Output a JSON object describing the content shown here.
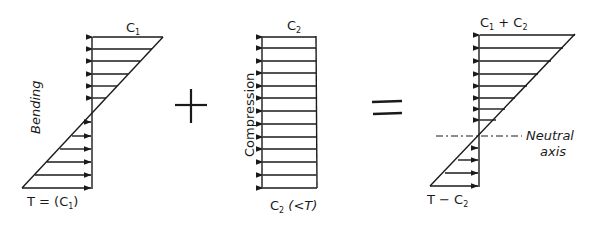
{
  "diagram": {
    "type": "stress-superposition",
    "colors": {
      "ink": "#1a1a1a",
      "background": "#ffffff"
    },
    "panels": [
      {
        "id": "bending",
        "side_label": "Bending",
        "top_label": {
          "main": "C",
          "sub": "1",
          "suffix": ""
        },
        "bottom_label": {
          "prefix": "T = (C",
          "sub": "1",
          "suffix": ")"
        },
        "distribution": "triangular-antisymmetric",
        "compression_arrows": 6,
        "tension_arrows": 6
      },
      {
        "id": "compression",
        "side_label": "Compression",
        "top_label": {
          "main": "C",
          "sub": "2",
          "suffix": ""
        },
        "bottom_label": {
          "prefix": "C",
          "sub": "2",
          "suffix": " (<T)"
        },
        "distribution": "uniform",
        "compression_arrows": 13
      },
      {
        "id": "combined",
        "top_label": {
          "main": "C",
          "sub": "1",
          "mid": " + C",
          "sub2": "2"
        },
        "bottom_label": {
          "prefix": "T − C",
          "sub": "2"
        },
        "axis_label_line1": "Neutral",
        "axis_label_line2": "axis",
        "distribution": "triangular-shifted",
        "compression_arrows": 8,
        "tension_arrows": 4
      }
    ],
    "operators": {
      "plus": "+",
      "equals": "="
    }
  }
}
